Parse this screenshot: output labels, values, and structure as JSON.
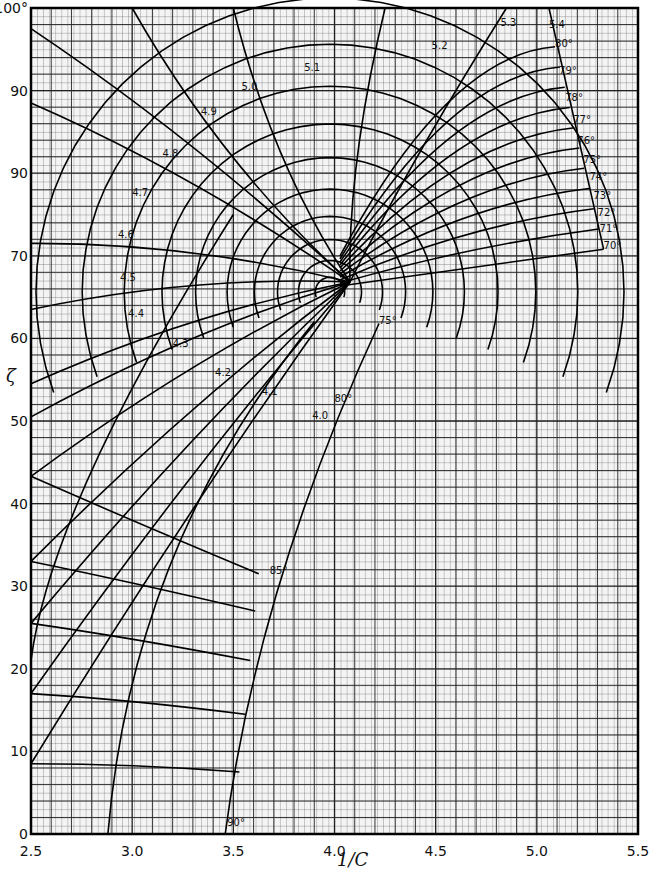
{
  "chart_data": {
    "type": "line",
    "title": "",
    "xlabel": "1/C",
    "ylabel": "ζ",
    "xlim": [
      2.5,
      5.5
    ],
    "ylim": [
      0,
      100
    ],
    "grid": true,
    "x_ticks": [
      "2.5",
      "3.0",
      "3.5",
      "4.0",
      "4.5",
      "5.0",
      "5.5"
    ],
    "y_ticks": [
      "0",
      "10",
      "20",
      "30",
      "40",
      "50",
      "60",
      "70",
      "90",
      "90",
      "100°"
    ],
    "y_tick_values": [
      0,
      10,
      20,
      30,
      40,
      50,
      60,
      70,
      80,
      90,
      100
    ],
    "series_families": {
      "spokes": {
        "description": "Radiating curves labeled by value",
        "labels": [
          "4.0",
          "4.1",
          "4.2",
          "4.3",
          "4.4",
          "4.5",
          "4.6",
          "4.7",
          "4.8",
          "4.9",
          "5.0",
          "5.1",
          "5.2",
          "5.3",
          "5.4"
        ]
      },
      "arcs": {
        "description": "Concentric angle contours",
        "labels": [
          "70°",
          "71°",
          "72°",
          "73°",
          "74°",
          "75°",
          "76°",
          "77°",
          "78°",
          "79°",
          "80°",
          "75°",
          "80°",
          "85°",
          "90°"
        ]
      }
    },
    "annotations": [
      {
        "text": "5.4",
        "x": 5.06,
        "y": 97.6
      },
      {
        "text": "80°",
        "x": 5.09,
        "y": 95.3
      },
      {
        "text": "79°",
        "x": 5.11,
        "y": 92.0
      },
      {
        "text": "78°",
        "x": 5.14,
        "y": 88.8
      },
      {
        "text": "77°",
        "x": 5.18,
        "y": 86.1
      },
      {
        "text": "76°",
        "x": 5.2,
        "y": 83.5
      },
      {
        "text": "75°",
        "x": 5.23,
        "y": 81.2
      },
      {
        "text": "74°",
        "x": 5.26,
        "y": 79.2
      },
      {
        "text": "73°",
        "x": 5.28,
        "y": 76.9
      },
      {
        "text": "72°",
        "x": 5.3,
        "y": 74.8
      },
      {
        "text": "71°",
        "x": 5.31,
        "y": 72.9
      },
      {
        "text": "70°",
        "x": 5.33,
        "y": 70.8
      },
      {
        "text": "5.3",
        "x": 4.82,
        "y": 97.8
      },
      {
        "text": "5.2",
        "x": 4.48,
        "y": 95.0
      },
      {
        "text": "5.1",
        "x": 3.85,
        "y": 92.4
      },
      {
        "text": "5.0",
        "x": 3.54,
        "y": 90.1
      },
      {
        "text": "4.9",
        "x": 3.34,
        "y": 87.0
      },
      {
        "text": "4.8",
        "x": 3.15,
        "y": 82.0
      },
      {
        "text": "4.7",
        "x": 3.0,
        "y": 77.3
      },
      {
        "text": "4.6",
        "x": 2.93,
        "y": 72.1
      },
      {
        "text": "4.5",
        "x": 2.94,
        "y": 67.0
      },
      {
        "text": "4.4",
        "x": 2.98,
        "y": 62.6
      },
      {
        "text": "4.3",
        "x": 3.2,
        "y": 58.9
      },
      {
        "text": "4.2",
        "x": 3.41,
        "y": 55.5
      },
      {
        "text": "4.1",
        "x": 3.64,
        "y": 53.2
      },
      {
        "text": "4.0",
        "x": 3.89,
        "y": 50.2
      },
      {
        "text": "80°",
        "x": 4.0,
        "y": 52.3
      },
      {
        "text": "75°",
        "x": 4.22,
        "y": 61.8
      },
      {
        "text": "85°",
        "x": 3.68,
        "y": 31.5
      },
      {
        "text": "90°",
        "x": 3.47,
        "y": 1.0
      }
    ]
  },
  "axis": {
    "x_label": "1/C",
    "y_label": "ζ"
  }
}
